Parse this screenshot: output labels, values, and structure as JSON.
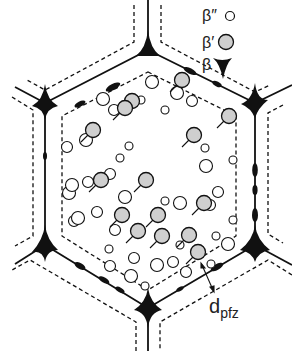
{
  "figure": {
    "colors": {
      "line": "#111111",
      "particle_fill_beta_prime": "#cfcfcf",
      "background": "#ffffff"
    }
  },
  "legend": {
    "items": [
      {
        "symbol": "β″",
        "shape": "small-open-circle"
      },
      {
        "symbol": "β′",
        "shape": "shaded-circle"
      },
      {
        "symbol": "β",
        "shape": "black-cusp-triangle"
      }
    ]
  },
  "annotation": {
    "dpfz_main": "d",
    "dpfz_sub": "pfz"
  },
  "diagram_data": {
    "grain_boundary_hexagon": [
      [
        148,
        50
      ],
      [
        255,
        103
      ],
      [
        255,
        245
      ],
      [
        148,
        308
      ],
      [
        45,
        245
      ],
      [
        45,
        103
      ]
    ],
    "pfz_inner_hexagon": [
      [
        148,
        72
      ],
      [
        236,
        116
      ],
      [
        236,
        236
      ],
      [
        148,
        290
      ],
      [
        62,
        236
      ],
      [
        62,
        116
      ]
    ],
    "beta_prime_particles": [
      [
        132,
        101
      ],
      [
        182,
        80
      ],
      [
        93,
        130
      ],
      [
        125,
        108
      ],
      [
        229,
        116
      ],
      [
        194,
        135
      ],
      [
        101,
        180
      ],
      [
        146,
        180
      ],
      [
        122,
        215
      ],
      [
        158,
        215
      ],
      [
        138,
        231
      ],
      [
        204,
        203
      ],
      [
        189,
        235
      ],
      [
        198,
        252
      ],
      [
        162,
        236
      ]
    ],
    "beta_double_prime_particles": [
      [
        114,
        110
      ],
      [
        165,
        110
      ],
      [
        177,
        93
      ],
      [
        67,
        147
      ],
      [
        205,
        148
      ],
      [
        103,
        99
      ],
      [
        74,
        221
      ],
      [
        129,
        146
      ],
      [
        206,
        166
      ],
      [
        110,
        174
      ],
      [
        233,
        160
      ],
      [
        86,
        140
      ],
      [
        192,
        101
      ],
      [
        141,
        100
      ],
      [
        152,
        82
      ],
      [
        218,
        192
      ],
      [
        120,
        158
      ],
      [
        69,
        193
      ],
      [
        97,
        212
      ],
      [
        165,
        201
      ],
      [
        180,
        203
      ],
      [
        210,
        205
      ],
      [
        233,
        220
      ],
      [
        78,
        218
      ],
      [
        134,
        258
      ],
      [
        109,
        249
      ],
      [
        157,
        265
      ],
      [
        186,
        272
      ],
      [
        211,
        264
      ],
      [
        72,
        185
      ],
      [
        115,
        230
      ],
      [
        180,
        245
      ],
      [
        125,
        197
      ],
      [
        88,
        182
      ],
      [
        216,
        236
      ],
      [
        228,
        244
      ],
      [
        173,
        262
      ],
      [
        145,
        286
      ],
      [
        131,
        276
      ],
      [
        110,
        266
      ]
    ]
  }
}
